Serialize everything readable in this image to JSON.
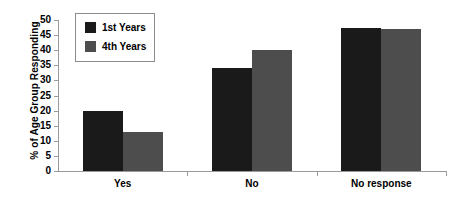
{
  "chart_data": {
    "type": "bar",
    "title": "",
    "subtitle": "",
    "xlabel": "",
    "ylabel": "% of Age Group Responding",
    "categories": [
      "Yes",
      "No",
      "No response"
    ],
    "series": [
      {
        "name": "1st Years",
        "color": "#1a1a1a",
        "values": [
          20,
          34,
          47.5
        ]
      },
      {
        "name": "4th Years",
        "color": "#4d4d4d",
        "values": [
          13,
          40,
          47
        ]
      }
    ],
    "ylim": [
      0,
      50
    ],
    "ytick_step": 5,
    "ytick_labels": [
      "50",
      "45",
      "40",
      "35",
      "30",
      "25",
      "20",
      "15",
      "10",
      "5",
      "0"
    ],
    "ytick_values": [
      50,
      45,
      40,
      35,
      30,
      25,
      20,
      15,
      10,
      5,
      0
    ],
    "grid": false,
    "legend_position": "upper-left-inside",
    "legend_border": true
  },
  "legend": {
    "entries": [
      {
        "label": "1st Years"
      },
      {
        "label": "4th Years"
      }
    ]
  },
  "colors": {
    "series_1st_years": "#1a1a1a",
    "series_4th_years": "#4d4d4d",
    "axis": "#9a9a9a",
    "text": "#000000",
    "background": "#ffffff"
  }
}
